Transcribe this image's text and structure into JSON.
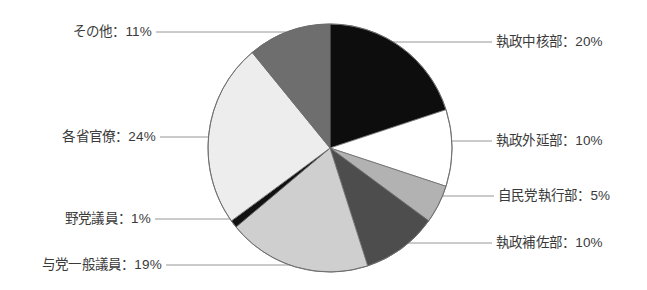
{
  "chart_data": {
    "type": "pie",
    "title": "",
    "subtitle": "",
    "xlabel": "",
    "ylabel": "",
    "legend_position": "callout-labels",
    "grid": false,
    "units": "%",
    "label_separator": "：",
    "total": 100,
    "categories": [
      "執政中核部",
      "執政外延部",
      "自民党執行部",
      "執政補佐部",
      "与党一般議員",
      "野党議員",
      "各省官僚",
      "その他"
    ],
    "values": [
      20,
      10,
      5,
      10,
      19,
      1,
      24,
      11
    ],
    "colors": [
      "#0d0d0d",
      "#ffffff",
      "#b2b2b2",
      "#4d4d4d",
      "#cfcfcf",
      "#111111",
      "#ededed",
      "#6e6e6e"
    ],
    "slices": [
      {
        "label": "執政中核部",
        "value": 20,
        "text": "執政中核部：20%",
        "color": "#0d0d0d",
        "side": "right"
      },
      {
        "label": "執政外延部",
        "value": 10,
        "text": "執政外延部：10%",
        "color": "#ffffff",
        "side": "right"
      },
      {
        "label": "自民党執行部",
        "value": 5,
        "text": "自民党執行部：5%",
        "color": "#b2b2b2",
        "side": "right"
      },
      {
        "label": "執政補佐部",
        "value": 10,
        "text": "執政補佐部：10%",
        "color": "#4d4d4d",
        "side": "right"
      },
      {
        "label": "与党一般議員",
        "value": 19,
        "text": "与党一般議員：19%",
        "color": "#cfcfcf",
        "side": "left"
      },
      {
        "label": "野党議員",
        "value": 1,
        "text": "野党議員：1%",
        "color": "#111111",
        "side": "left"
      },
      {
        "label": "各省官僚",
        "value": 24,
        "text": "各省官僚：24%",
        "color": "#ededed",
        "side": "left"
      },
      {
        "label": "その他",
        "value": 11,
        "text": "その他：11%",
        "color": "#6e6e6e",
        "side": "left"
      }
    ]
  },
  "labels": {
    "core": "執政中核部：20%",
    "outer": "執政外延部：10%",
    "ldp_exec": "自民党執行部：5%",
    "support": "執政補佐部：10%",
    "ruling_members": "与党一般議員：19%",
    "opposition": "野党議員：1%",
    "bureaucrats": "各省官僚：24%",
    "other": "その他：11%"
  },
  "style": {
    "label_color": "#3a3a3a",
    "leader_color": "#8a8a8a",
    "outline_color": "#6b6b6b",
    "background": "#ffffff"
  }
}
